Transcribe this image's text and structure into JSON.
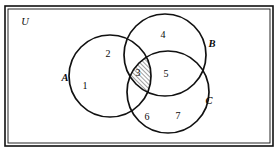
{
  "figure": {
    "type": "venn-diagram-3-set",
    "universe_label": "U",
    "background_color": "#ffffff",
    "stroke_color": "#111111"
  },
  "universe": {
    "label": "U",
    "label_x": 25,
    "label_y": 25,
    "rect": {
      "x": 5,
      "y": 6,
      "width": 268,
      "height": 140
    },
    "border_style": "double-line"
  },
  "sets": [
    {
      "name": "A",
      "label": "A",
      "cx": 110,
      "cy": 76,
      "r": 41,
      "label_x": 65,
      "label_y": 81
    },
    {
      "name": "B",
      "label": "B",
      "cx": 165,
      "cy": 55,
      "r": 41,
      "label_x": 212,
      "label_y": 47
    },
    {
      "name": "C",
      "label": "C",
      "cx": 168,
      "cy": 92,
      "r": 41,
      "label_x": 209,
      "label_y": 104
    }
  ],
  "regions": [
    {
      "id": "r1",
      "label": "1",
      "meaning": "A only",
      "x": 85,
      "y": 89,
      "shaded": false
    },
    {
      "id": "r2",
      "label": "2",
      "meaning": "A and B only",
      "x": 108,
      "y": 57,
      "shaded": false
    },
    {
      "id": "r3",
      "label": "3",
      "meaning": "A and B and C",
      "x": 138,
      "y": 76,
      "shaded": true
    },
    {
      "id": "r4",
      "label": "4",
      "meaning": "B only",
      "x": 163,
      "y": 38,
      "shaded": false
    },
    {
      "id": "r5",
      "label": "5",
      "meaning": "B and C only",
      "x": 166,
      "y": 77,
      "shaded": false
    },
    {
      "id": "r6",
      "label": "6",
      "meaning": "A and C only",
      "x": 147,
      "y": 120,
      "shaded": false
    },
    {
      "id": "r7",
      "label": "7",
      "meaning": "C only",
      "x": 178,
      "y": 119,
      "shaded": false
    }
  ],
  "shading": {
    "region_id": "r3",
    "pattern": "diagonal-hatch",
    "direction": "lower-left-to-upper-right",
    "line_color": "#111111",
    "spacing_px": 3
  }
}
